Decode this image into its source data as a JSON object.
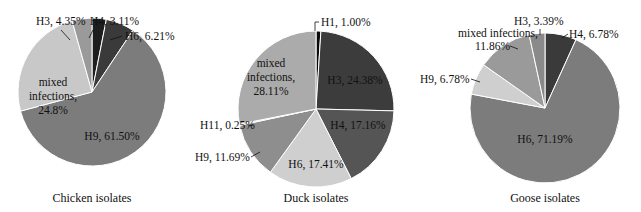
{
  "chart_data": [
    {
      "type": "pie",
      "title": "Chicken isolates",
      "categories": [
        "H4",
        "H6",
        "H9",
        "mixed infections",
        "H3"
      ],
      "values": [
        3.11,
        6.21,
        61.5,
        24.8,
        4.35
      ],
      "labels": [
        "H4, 3.11%",
        "H6, 6.21%",
        "H9, 61.50%",
        "mixed infections, 24.8%",
        "H3, 4.35%"
      ],
      "colors": [
        "#1e1e1e",
        "#3a3a3a",
        "#7c7c7c",
        "#c8c8c8",
        "#9a9a9a"
      ]
    },
    {
      "type": "pie",
      "title": "Duck isolates",
      "categories": [
        "H1",
        "H3",
        "H4",
        "H6",
        "H9",
        "H11",
        "mixed infections"
      ],
      "values": [
        1.0,
        24.38,
        17.16,
        17.41,
        11.69,
        0.25,
        28.11
      ],
      "labels": [
        "H1, 1.00%",
        "H3, 24.38%",
        "H4, 17.16%",
        "H6, 17.41%",
        "H9, 11.69%",
        "H11, 0.25%",
        "mixed infections, 28.11%"
      ],
      "colors": [
        "#0a0a0a",
        "#3c3c3c",
        "#555555",
        "#cfcfcf",
        "#8e8e8e",
        "#e0e0e0",
        "#ababab"
      ]
    },
    {
      "type": "pie",
      "title": "Goose isolates",
      "categories": [
        "H4",
        "H6",
        "H9",
        "mixed infections",
        "H3"
      ],
      "values": [
        6.78,
        71.19,
        6.78,
        11.86,
        3.39
      ],
      "labels": [
        "H4, 6.78%",
        "H6, 71.19%",
        "H9, 6.78%",
        "mixed infections, 11.86%",
        "H3, 3.39%"
      ],
      "colors": [
        "#3a3a3a",
        "#7c7c7c",
        "#cfcfcf",
        "#9a9a9a",
        "#8a8a8a"
      ]
    }
  ],
  "captions": {
    "chicken": "Chicken isolates",
    "duck": "Duck isolates",
    "goose": "Goose isolates"
  },
  "labels": {
    "chicken": {
      "h3": "H3, 4.35%",
      "h4": "H4, 3.11%",
      "h6": "H6, 6.21%",
      "mixed_1": "mixed",
      "mixed_2": "infections,",
      "mixed_3": "24.8%",
      "h9": "H9, 61.50%"
    },
    "duck": {
      "h1": "H1, 1.00%",
      "mixed_1": "mixed",
      "mixed_2": "infections,",
      "mixed_3": "28.11%",
      "h3": "H3, 24.38%",
      "h4": "H4, 17.16%",
      "h11": "H11, 0.25%",
      "h9": "H9, 11.69%",
      "h6": "H6, 17.41%"
    },
    "goose": {
      "mixed_1": "mixed infections,",
      "mixed_2": "11.86%",
      "h3": "H3, 3.39%",
      "h4": "H4, 6.78%",
      "h9": "H9, 6.78%",
      "h6": "H6, 71.19%"
    }
  }
}
